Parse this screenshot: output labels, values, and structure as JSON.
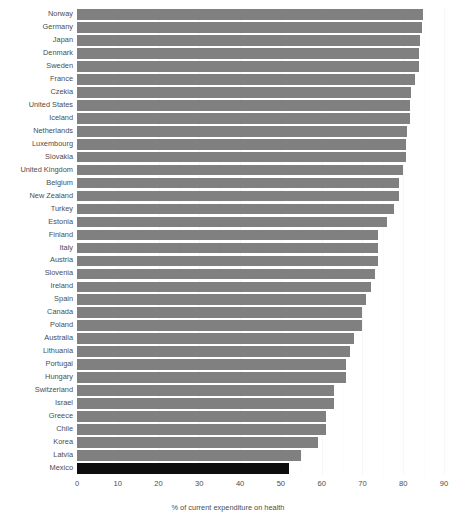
{
  "chart_data": {
    "type": "bar",
    "orientation": "horizontal",
    "title": "",
    "subtitle": "",
    "xlabel": "% of current expenditure on health",
    "ylabel": "",
    "xlim": [
      0,
      90
    ],
    "xticks": [
      0,
      10,
      20,
      30,
      40,
      50,
      60,
      70,
      80,
      90
    ],
    "xtick_labels": [
      "0",
      "10",
      "20",
      "30",
      "40",
      "50",
      "60",
      "70",
      "80",
      "90"
    ],
    "grid": true,
    "legend": "none",
    "bar_color": "#808080",
    "highlight_color": "#0d0d0d",
    "highlight_category": "Mexico",
    "categories": [
      "Norway",
      "Germany",
      "Japan",
      "Denmark",
      "Sweden",
      "France",
      "Czekia",
      "United States",
      "Iceland",
      "Netherlands",
      "Luxembourg",
      "Slovakia",
      "United Kingdom",
      "Belgium",
      "New Zealand",
      "Turkey",
      "Estonia",
      "Finland",
      "Italy",
      "Austria",
      "Slovenia",
      "Ireland",
      "Spain",
      "Canada",
      "Poland",
      "Australia",
      "Lithuania",
      "Portugal",
      "Hungary",
      "Switzerland",
      "Israel",
      "Greece",
      "Chile",
      "Korea",
      "Latvia",
      "Mexico"
    ],
    "values": [
      84.8,
      84.7,
      84.0,
      83.9,
      83.8,
      83.0,
      81.9,
      81.7,
      81.7,
      80.9,
      80.8,
      80.8,
      79.9,
      78.9,
      78.9,
      77.8,
      76.0,
      73.9,
      73.9,
      73.9,
      73.0,
      72.1,
      70.9,
      70.0,
      70.0,
      67.9,
      67.0,
      66.0,
      66.0,
      63.0,
      63.0,
      61.0,
      61.0,
      59.0,
      55.0,
      52.0
    ]
  }
}
